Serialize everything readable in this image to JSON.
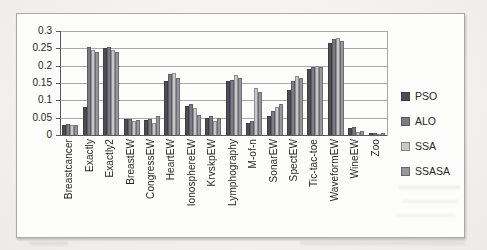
{
  "chart_data": {
    "type": "bar",
    "title": "",
    "xlabel": "",
    "ylabel": "",
    "ylim": [
      0,
      0.3
    ],
    "yticks": [
      "0",
      "0.05",
      "0.1",
      "0.15",
      "0.2",
      "0.25",
      "0.3"
    ],
    "grid": true,
    "legend_position": "right",
    "categories": [
      "Breastcancer",
      "Exactly",
      "Exactly2",
      "BreastEW",
      "CongressEW",
      "HeartEW",
      "IonosphereEW",
      "KrvskpEW",
      "Lymphography",
      "M-of-n",
      "SonarEW",
      "SpectEW",
      "Tic-tac-toe",
      "WaveformEW",
      "WineEW",
      "Zoo"
    ],
    "series": [
      {
        "name": "PSO",
        "color": "#4d4d53",
        "values": [
          0.03,
          0.08,
          0.25,
          0.045,
          0.043,
          0.155,
          0.085,
          0.048,
          0.155,
          0.035,
          0.055,
          0.13,
          0.19,
          0.265,
          0.02,
          0.006
        ]
      },
      {
        "name": "ALO",
        "color": "#7b7b81",
        "values": [
          0.032,
          0.253,
          0.253,
          0.047,
          0.045,
          0.175,
          0.09,
          0.055,
          0.16,
          0.04,
          0.07,
          0.155,
          0.195,
          0.277,
          0.022,
          0.007
        ]
      },
      {
        "name": "SSA",
        "color": "#c8c8ca",
        "values": [
          0.028,
          0.245,
          0.245,
          0.04,
          0.035,
          0.178,
          0.078,
          0.04,
          0.172,
          0.135,
          0.08,
          0.17,
          0.2,
          0.28,
          0.01,
          0.004
        ]
      },
      {
        "name": "SSASA",
        "color": "#96969c",
        "values": [
          0.03,
          0.24,
          0.24,
          0.043,
          0.055,
          0.165,
          0.057,
          0.05,
          0.165,
          0.125,
          0.09,
          0.165,
          0.195,
          0.272,
          0.012,
          0.005
        ]
      }
    ]
  },
  "colors": {
    "page_bg": "#f6f5f2",
    "chart_bg": "#fdfdfc",
    "grid": "#8e8e8e",
    "axis": "#5a5a5a",
    "frame_border": "#a9a9a9",
    "text": "#262626"
  }
}
